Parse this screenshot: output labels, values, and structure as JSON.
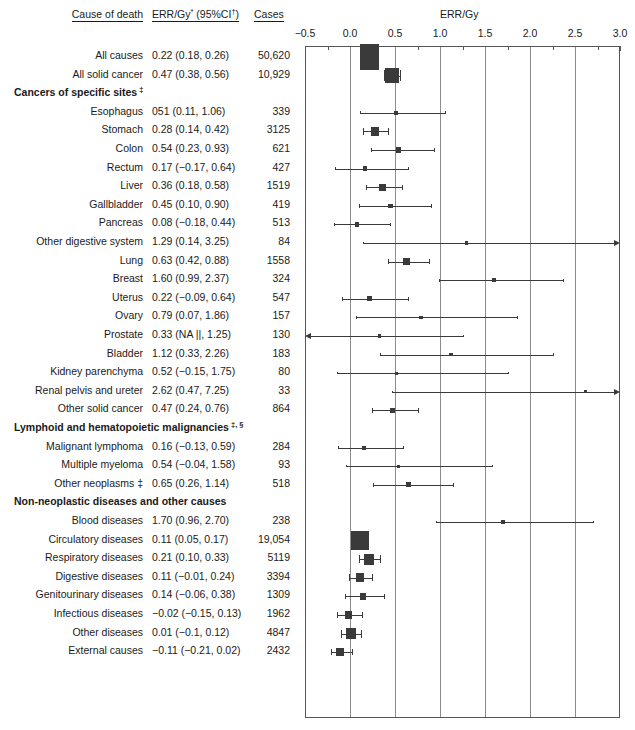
{
  "table": {
    "headers": {
      "cause": "Cause of death",
      "err": "ERR/Gy",
      "err_sup1": "*",
      "err_ci": "(95%CI",
      "err_sup2": "†",
      "err_ci_close": ")",
      "cases": "Cases"
    }
  },
  "plot": {
    "title": "ERR/Gy",
    "axis": {
      "min": -0.5,
      "max": 3.0,
      "major_step": 0.5,
      "minor_step": 0.25,
      "ticks": [
        "-0.5",
        "0.0",
        "0.5",
        "1.0",
        "1.5",
        "2.0",
        "2.5",
        "3.0"
      ],
      "tick_values": [
        -0.5,
        0,
        0.5,
        1.0,
        1.5,
        2.0,
        2.5,
        3.0
      ],
      "grid": true
    },
    "marker_color": "#3a3a3a",
    "grid_color": "#8c8c8c"
  },
  "chart_data": {
    "type": "forest",
    "title": "ERR/Gy",
    "xlabel": "ERR/Gy",
    "xlim": [
      -0.5,
      3.0
    ],
    "grid": true,
    "columns": [
      "Cause of death",
      "ERR/Gy (95%CI)",
      "Cases"
    ],
    "rows": [
      {
        "kind": "section",
        "label": "",
        "spacer": true
      },
      {
        "kind": "data",
        "label": "All causes",
        "err_text": "0.22 (0.18, 0.26)",
        "cases": "50,620",
        "est": 0.22,
        "lo": 0.18,
        "hi": 0.26,
        "n": 50620,
        "lo_arrow": false,
        "hi_arrow": false
      },
      {
        "kind": "data",
        "label": "All solid cancer",
        "err_text": "0.47 (0.38, 0.56)",
        "cases": "10,929",
        "est": 0.47,
        "lo": 0.38,
        "hi": 0.56,
        "n": 10929,
        "lo_arrow": false,
        "hi_arrow": false
      },
      {
        "kind": "section",
        "label": "Cancers of specific sites",
        "sup": "‡"
      },
      {
        "kind": "data",
        "label": "Esophagus",
        "err_text": "051 (0.11, 1.06)",
        "cases": "339",
        "est": 0.51,
        "lo": 0.11,
        "hi": 1.06,
        "n": 339,
        "lo_arrow": false,
        "hi_arrow": false
      },
      {
        "kind": "data",
        "label": "Stomach",
        "err_text": "0.28 (0.14, 0.42)",
        "cases": "3125",
        "est": 0.28,
        "lo": 0.14,
        "hi": 0.42,
        "n": 3125,
        "lo_arrow": false,
        "hi_arrow": false
      },
      {
        "kind": "data",
        "label": "Colon",
        "err_text": "0.54 (0.23, 0.93)",
        "cases": "621",
        "est": 0.54,
        "lo": 0.23,
        "hi": 0.93,
        "n": 621,
        "lo_arrow": false,
        "hi_arrow": false
      },
      {
        "kind": "data",
        "label": "Rectum",
        "err_text": "0.17 (−0.17, 0.64)",
        "cases": "427",
        "est": 0.17,
        "lo": -0.17,
        "hi": 0.64,
        "n": 427,
        "lo_arrow": false,
        "hi_arrow": false
      },
      {
        "kind": "data",
        "label": "Liver",
        "err_text": "0.36 (0.18, 0.58)",
        "cases": "1519",
        "est": 0.36,
        "lo": 0.18,
        "hi": 0.58,
        "n": 1519,
        "lo_arrow": false,
        "hi_arrow": false
      },
      {
        "kind": "data",
        "label": "Gallbladder",
        "err_text": "0.45 (0.10, 0.90)",
        "cases": "419",
        "est": 0.45,
        "lo": 0.1,
        "hi": 0.9,
        "n": 419,
        "lo_arrow": false,
        "hi_arrow": false
      },
      {
        "kind": "data",
        "label": "Pancreas",
        "err_text": "0.08 (−0.18, 0.44)",
        "cases": "513",
        "est": 0.08,
        "lo": -0.18,
        "hi": 0.44,
        "n": 513,
        "lo_arrow": false,
        "hi_arrow": false
      },
      {
        "kind": "data",
        "label": "Other digestive system",
        "err_text": "1.29 (0.14, 3.25)",
        "cases": "84",
        "est": 1.29,
        "lo": 0.14,
        "hi": 3.25,
        "n": 84,
        "lo_arrow": false,
        "hi_arrow": true
      },
      {
        "kind": "data",
        "label": "Lung",
        "err_text": "0.63 (0.42, 0.88)",
        "cases": "1558",
        "est": 0.63,
        "lo": 0.42,
        "hi": 0.88,
        "n": 1558,
        "lo_arrow": false,
        "hi_arrow": false
      },
      {
        "kind": "data",
        "label": "Breast",
        "err_text": "1.60 (0.99, 2.37)",
        "cases": "324",
        "est": 1.6,
        "lo": 0.99,
        "hi": 2.37,
        "n": 324,
        "lo_arrow": false,
        "hi_arrow": false
      },
      {
        "kind": "data",
        "label": "Uterus",
        "err_text": "0.22 (−0.09, 0.64)",
        "cases": "547",
        "est": 0.22,
        "lo": -0.09,
        "hi": 0.64,
        "n": 547,
        "lo_arrow": false,
        "hi_arrow": false
      },
      {
        "kind": "data",
        "label": "Ovary",
        "err_text": "0.79 (0.07, 1.86)",
        "cases": "157",
        "est": 0.79,
        "lo": 0.07,
        "hi": 1.86,
        "n": 157,
        "lo_arrow": false,
        "hi_arrow": false
      },
      {
        "kind": "data",
        "label": "Prostate",
        "err_text": "0.33 (NA ||, 1.25)",
        "cases": "130",
        "est": 0.33,
        "lo": -0.5,
        "hi": 1.25,
        "n": 130,
        "lo_arrow": true,
        "hi_arrow": false
      },
      {
        "kind": "data",
        "label": "Bladder",
        "err_text": "1.12 (0.33, 2.26)",
        "cases": "183",
        "est": 1.12,
        "lo": 0.33,
        "hi": 2.26,
        "n": 183,
        "lo_arrow": false,
        "hi_arrow": false
      },
      {
        "kind": "data",
        "label": "Kidney parenchyma",
        "err_text": "0.52 (−0.15, 1.75)",
        "cases": "80",
        "est": 0.52,
        "lo": -0.15,
        "hi": 1.75,
        "n": 80,
        "lo_arrow": false,
        "hi_arrow": false
      },
      {
        "kind": "data",
        "label": "Renal pelvis and ureter",
        "err_text": "2.62 (0.47, 7.25)",
        "cases": "33",
        "est": 2.62,
        "lo": 0.47,
        "hi": 7.25,
        "n": 33,
        "lo_arrow": false,
        "hi_arrow": true
      },
      {
        "kind": "data",
        "label": "Other solid cancer",
        "err_text": "0.47 (0.24, 0.76)",
        "cases": "864",
        "est": 0.47,
        "lo": 0.24,
        "hi": 0.76,
        "n": 864,
        "lo_arrow": false,
        "hi_arrow": false
      },
      {
        "kind": "section",
        "label": "Lymphoid and hematopoietic malignancies",
        "sup": "‡, §"
      },
      {
        "kind": "data",
        "label": "Malignant lymphoma",
        "err_text": "0.16 (−0.13, 0.59)",
        "cases": "284",
        "est": 0.16,
        "lo": -0.13,
        "hi": 0.59,
        "n": 284,
        "lo_arrow": false,
        "hi_arrow": false
      },
      {
        "kind": "data",
        "label": "Multiple myeloma",
        "err_text": "0.54 (−0.04, 1.58)",
        "cases": "93",
        "est": 0.54,
        "lo": -0.04,
        "hi": 1.58,
        "n": 93,
        "lo_arrow": false,
        "hi_arrow": false
      },
      {
        "kind": "data",
        "label": "Other neoplasms ‡",
        "err_text": "0.65 (0.26, 1.14)",
        "cases": "518",
        "est": 0.65,
        "lo": 0.26,
        "hi": 1.14,
        "n": 518,
        "lo_arrow": false,
        "hi_arrow": false
      },
      {
        "kind": "section",
        "label": "Non-neoplastic diseases and other causes",
        "sup": ""
      },
      {
        "kind": "data",
        "label": "Blood diseases",
        "err_text": "1.70 (0.96, 2.70)",
        "cases": "238",
        "est": 1.7,
        "lo": 0.96,
        "hi": 2.7,
        "n": 238,
        "lo_arrow": false,
        "hi_arrow": false
      },
      {
        "kind": "data",
        "label": "Circulatory diseases",
        "err_text": "0.11 (0.05, 0.17)",
        "cases": "19,054",
        "est": 0.11,
        "lo": 0.05,
        "hi": 0.17,
        "n": 19054,
        "lo_arrow": false,
        "hi_arrow": false
      },
      {
        "kind": "data",
        "label": "Respiratory diseases",
        "err_text": "0.21 (0.10, 0.33)",
        "cases": "5119",
        "est": 0.21,
        "lo": 0.1,
        "hi": 0.33,
        "n": 5119,
        "lo_arrow": false,
        "hi_arrow": false
      },
      {
        "kind": "data",
        "label": "Digestive diseases",
        "err_text": "0.11 (−0.01, 0.24)",
        "cases": "3394",
        "est": 0.11,
        "lo": -0.01,
        "hi": 0.24,
        "n": 3394,
        "lo_arrow": false,
        "hi_arrow": false
      },
      {
        "kind": "data",
        "label": "Genitourinary diseases",
        "err_text": "0.14 (−0.06, 0.38)",
        "cases": "1309",
        "est": 0.14,
        "lo": -0.06,
        "hi": 0.38,
        "n": 1309,
        "lo_arrow": false,
        "hi_arrow": false
      },
      {
        "kind": "data",
        "label": "Infectious diseases",
        "err_text": "−0.02 (−0.15, 0.13)",
        "cases": "1962",
        "est": -0.02,
        "lo": -0.15,
        "hi": 0.13,
        "n": 1962,
        "lo_arrow": false,
        "hi_arrow": false
      },
      {
        "kind": "data",
        "label": "Other diseases",
        "err_text": "0.01 (−0.1, 0.12)",
        "cases": "4847",
        "est": 0.01,
        "lo": -0.1,
        "hi": 0.12,
        "n": 4847,
        "lo_arrow": false,
        "hi_arrow": false
      },
      {
        "kind": "data",
        "label": "External causes",
        "err_text": "−0.11 (−0.21, 0.02)",
        "cases": "2432",
        "est": -0.11,
        "lo": -0.21,
        "hi": 0.02,
        "n": 2432,
        "lo_arrow": false,
        "hi_arrow": false
      }
    ]
  }
}
